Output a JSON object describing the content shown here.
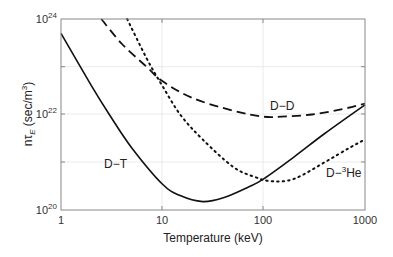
{
  "chart_data": {
    "type": "line",
    "title": "",
    "xlabel": "Temperature (keV)",
    "ylabel": "nτ_E (sec/m^3)",
    "xscale": "log",
    "yscale": "log",
    "xlim": [
      1,
      1000
    ],
    "ylim": [
      1e+20,
      1e+24
    ],
    "x_ticks": [
      "1",
      "10",
      "100",
      "1000"
    ],
    "y_ticks": [
      "10^20",
      "10^22",
      "10^24"
    ],
    "grid": true,
    "series": [
      {
        "name": "D-T",
        "style": "solid",
        "points": [
          [
            1,
            5e+23
          ],
          [
            2,
            4e+22
          ],
          [
            3,
            1e+22
          ],
          [
            5,
            2e+21
          ],
          [
            10,
            3.5e+20
          ],
          [
            15,
            2e+20
          ],
          [
            25,
            1.5e+20
          ],
          [
            40,
            1.8e+20
          ],
          [
            70,
            3e+20
          ],
          [
            100,
            4.5e+20
          ],
          [
            200,
            1.3e+21
          ],
          [
            400,
            4e+21
          ],
          [
            1000,
            1.6e+22
          ]
        ]
      },
      {
        "name": "D-D",
        "style": "dashed",
        "points": [
          [
            2.5,
            1e+24
          ],
          [
            4,
            3e+23
          ],
          [
            7,
            1e+23
          ],
          [
            10,
            5e+22
          ],
          [
            20,
            2.2e+22
          ],
          [
            50,
            1.2e+22
          ],
          [
            100,
            9e+21
          ],
          [
            150,
            9e+21
          ],
          [
            300,
            1e+22
          ],
          [
            600,
            1.3e+22
          ],
          [
            1000,
            1.7e+22
          ]
        ]
      },
      {
        "name": "D-3He",
        "style": "dotted",
        "points": [
          [
            4.5,
            1e+24
          ],
          [
            7,
            1.5e+23
          ],
          [
            10,
            4e+22
          ],
          [
            15,
            1e+22
          ],
          [
            25,
            3e+21
          ],
          [
            50,
            8e+20
          ],
          [
            80,
            5e+20
          ],
          [
            120,
            4e+20
          ],
          [
            200,
            4.5e+20
          ],
          [
            400,
            1e+21
          ],
          [
            700,
            2e+21
          ],
          [
            1000,
            3e+21
          ]
        ]
      }
    ],
    "annotations": [
      {
        "text": "D−T",
        "x": 7,
        "y": 5e+20
      },
      {
        "text": "D−D",
        "x": 140,
        "y": 2e+22
      },
      {
        "text": "D−³He",
        "x": 400,
        "y": 5e+20
      }
    ]
  },
  "labels": {
    "xlabel": "Temperature (keV)",
    "ylabel_main": "nτ",
    "ylabel_sub": "E",
    "ylabel_unit": " (sec/m",
    "ylabel_sup": "3",
    "ylabel_close": ")",
    "x1": "1",
    "x10": "10",
    "x100": "100",
    "x1000": "1000",
    "y_base": "10",
    "y20": "20",
    "y22": "22",
    "y24": "24",
    "dt": "D−T",
    "dd": "D−D",
    "dhe_a": "D−",
    "dhe_sup": "3",
    "dhe_b": "He"
  }
}
